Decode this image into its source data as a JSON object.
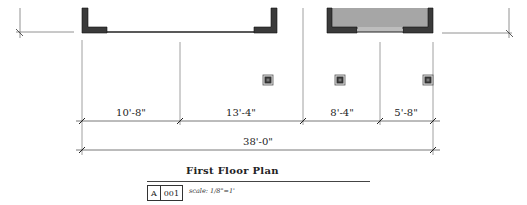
{
  "drawing": {
    "title": "First Floor Plan",
    "sheet_letter": "A",
    "sheet_number": "001",
    "scale_label": "scale: 1/8\"=1'",
    "colors": {
      "wall_fill": "#3a3a3a",
      "room_fill": "#a6a6a6",
      "line": "#555555",
      "text": "#222222"
    }
  },
  "dimensions": {
    "segments": [
      {
        "label": "10'-8\"",
        "x_start": 82,
        "x_end": 180
      },
      {
        "label": "13'-4\"",
        "x_start": 180,
        "x_end": 303
      },
      {
        "label": "8'-4\"",
        "x_start": 303,
        "x_end": 380
      },
      {
        "label": "5'-8\"",
        "x_start": 380,
        "x_end": 433
      }
    ],
    "total": {
      "label": "38'-0\"",
      "x_start": 82,
      "x_end": 433
    }
  },
  "columns": [
    {
      "x": 268,
      "y": 80
    },
    {
      "x": 340,
      "y": 80
    },
    {
      "x": 428,
      "y": 80
    }
  ]
}
